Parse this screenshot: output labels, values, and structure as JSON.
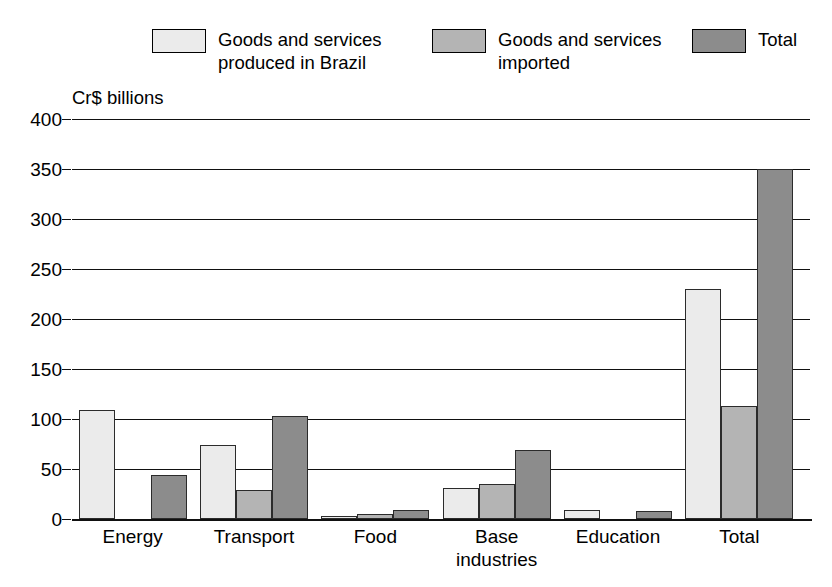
{
  "chart_data": {
    "type": "bar",
    "title": "",
    "ylabel": "Cr$ billions",
    "xlabel": "",
    "ylim": [
      0,
      400
    ],
    "ytick_step": 50,
    "yticks": [
      0,
      50,
      100,
      150,
      200,
      250,
      300,
      350,
      400
    ],
    "grid": true,
    "legend_position": "top",
    "categories": [
      "Energy",
      "Transport",
      "Food",
      "Base\nindustries",
      "Education",
      "Total"
    ],
    "series": [
      {
        "name": "Goods and services\nproduced in Brazil",
        "key": "produced",
        "color": "#ebebeb",
        "values": [
          109,
          74,
          3,
          31,
          9,
          230
        ]
      },
      {
        "name": "Goods and services\nimported",
        "key": "imported",
        "color": "#b4b4b4",
        "values": [
          0,
          29,
          5,
          35,
          0,
          113
        ]
      },
      {
        "name": "Total",
        "key": "total",
        "color": "#8c8c8c",
        "values": [
          44,
          103,
          9,
          69,
          8,
          350
        ]
      }
    ]
  },
  "legend": {
    "items": [
      {
        "label": "Goods and services\nproduced in Brazil",
        "swatch": "#ebebeb"
      },
      {
        "label": "Goods and services\nimported",
        "swatch": "#b4b4b4"
      },
      {
        "label": "Total",
        "swatch": "#8c8c8c"
      }
    ]
  },
  "axis": {
    "unit_title": "Cr$ billions",
    "tick_labels": [
      "400",
      "350",
      "300",
      "250",
      "200",
      "150",
      "100",
      "50",
      "0"
    ]
  },
  "colors": {
    "produced": "#ebebeb",
    "imported": "#b4b4b4",
    "total": "#8c8c8c",
    "line": "#111111",
    "background": "#ffffff"
  }
}
